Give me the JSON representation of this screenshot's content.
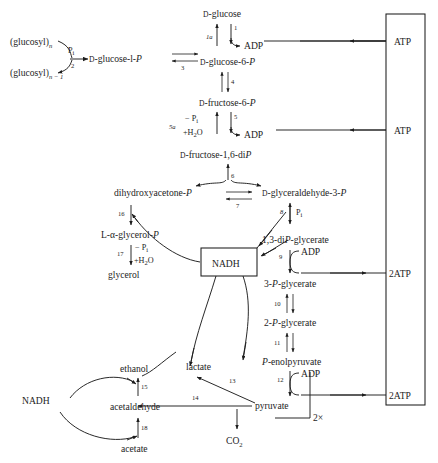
{
  "diagram": {
    "type": "metabolic-pathway-diagram",
    "colors": {
      "ink": "#1d1d1d",
      "background": "#ffffff"
    },
    "metabolites": {
      "glucosyl_n": "(glucosyl)",
      "glucosyl_n_sub": "n",
      "glucosyl_n1": "(glucosyl)",
      "glucosyl_n1_sub": "n − 1",
      "glucose_1_p_prefix": "D",
      "glucose_1_p": "-glucose-l-",
      "glucose_1_p_italic": "P",
      "d_glucose_prefix": "D",
      "d_glucose": "-glucose",
      "glucose_6_p": "-glucose-6-",
      "fructose_6_p": "-fructose-6-",
      "fructose_16_dip": "-fructose-1,6-di",
      "dhap": "dihydroxyacetone-",
      "g3p": "-glyceraldehyde-3-",
      "glycerol_p_prefix": "L-α-glycerol-",
      "glycerol": "glycerol",
      "dipg": "1,3-di",
      "dipg_tail": "-glycerate",
      "pg3": "3-",
      "pg3_tail": "-glycerate",
      "pg2": "2-",
      "pg2_tail": "-glycerate",
      "pep_tail": "-enolpyruvate",
      "pyruvate": "pyruvate",
      "lactate": "lactate",
      "ethanol": "ethanol",
      "acetaldehyde": "acetaldehyde",
      "acetate": "acetate",
      "co2": "CO",
      "co2_sub": "2",
      "nadh_box": "NADH",
      "nadh_left": "NADH",
      "italic_P": "P"
    },
    "cofactors": {
      "pi_1": "P",
      "pi_sub": "i",
      "adp_1": "ADP",
      "adp_2": "ADP",
      "adp_3": "ADP",
      "adp_4": "ADP",
      "minus_pi": "− P",
      "plus_h2o": "+H",
      "h2o_sub": "2",
      "h2o_tail": "O",
      "minus_pi_2": "− P",
      "plus_h2o_2": "+H",
      "pi_g3p": "P",
      "two_times": "2×"
    },
    "atp_box": {
      "label": "ATP/2ATP yield column",
      "entries": [
        "ATP",
        "ATP",
        "2ATP",
        "2ATP"
      ]
    },
    "step_numbers": {
      "s1": "1",
      "s1a": "1a",
      "s2": "2",
      "s3": "3",
      "s4": "4",
      "s5": "5",
      "s5a": "5a",
      "s6": "6",
      "s7": "7",
      "s8": "8",
      "s9": "9",
      "s10": "10",
      "s11": "11",
      "s12": "12",
      "s13": "13",
      "s14": "14",
      "s15": "15",
      "s16": "16",
      "s17": "17",
      "s18": "18"
    }
  }
}
